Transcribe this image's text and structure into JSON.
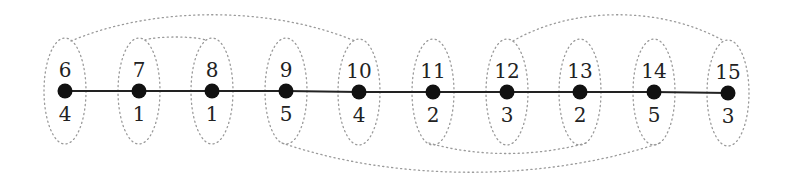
{
  "diagram": {
    "type": "path-graph",
    "nodes": [
      {
        "id": "6",
        "x": 65,
        "y": 91,
        "weight": "4"
      },
      {
        "id": "7",
        "x": 139,
        "y": 91,
        "weight": "1"
      },
      {
        "id": "8",
        "x": 212,
        "y": 91,
        "weight": "1"
      },
      {
        "id": "9",
        "x": 286,
        "y": 91,
        "weight": "5"
      },
      {
        "id": "10",
        "x": 359,
        "y": 92,
        "weight": "4"
      },
      {
        "id": "11",
        "x": 433,
        "y": 92,
        "weight": "2"
      },
      {
        "id": "12",
        "x": 507,
        "y": 92,
        "weight": "3"
      },
      {
        "id": "13",
        "x": 580,
        "y": 92,
        "weight": "2"
      },
      {
        "id": "14",
        "x": 654,
        "y": 92,
        "weight": "5"
      },
      {
        "id": "15",
        "x": 728,
        "y": 93,
        "weight": "3"
      }
    ],
    "edges": [
      [
        "6",
        "7"
      ],
      [
        "7",
        "8"
      ],
      [
        "8",
        "9"
      ],
      [
        "9",
        "10"
      ],
      [
        "10",
        "11"
      ],
      [
        "11",
        "12"
      ],
      [
        "12",
        "13"
      ],
      [
        "13",
        "14"
      ],
      [
        "14",
        "15"
      ]
    ],
    "group_arcs": [
      {
        "from": "6",
        "to": "10",
        "side": "top"
      },
      {
        "from": "7",
        "to": "8",
        "side": "top"
      },
      {
        "from": "12",
        "to": "15",
        "side": "top"
      },
      {
        "from": "9",
        "to": "14",
        "side": "bottom"
      },
      {
        "from": "11",
        "to": "13",
        "side": "bottom"
      }
    ]
  }
}
